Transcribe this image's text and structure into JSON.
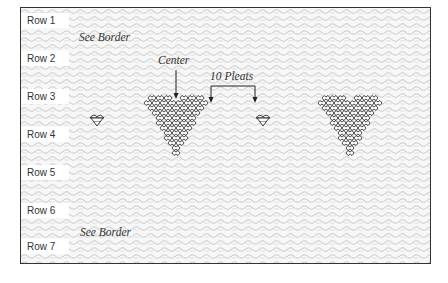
{
  "diagram": {
    "rows": [
      {
        "label": "Row 1",
        "top": 5
      },
      {
        "label": "Row 2",
        "top": 43
      },
      {
        "label": "Row 3",
        "top": 81
      },
      {
        "label": "Row 4",
        "top": 119
      },
      {
        "label": "Row 5",
        "top": 157
      },
      {
        "label": "Row 6",
        "top": 195
      },
      {
        "label": "Row 7",
        "top": 231
      }
    ],
    "annotations": {
      "see_border_top": "See Border",
      "center": "Center",
      "ten_pleats": "10 Pleats",
      "see_border_bottom": "See Border"
    },
    "motifs": [
      {
        "type": "small-motif",
        "x": 97,
        "y": 120
      },
      {
        "type": "heart-motif",
        "x": 178,
        "y": 95
      },
      {
        "type": "small-motif",
        "x": 263,
        "y": 120
      },
      {
        "type": "heart-motif",
        "x": 350,
        "y": 95
      }
    ],
    "colors": {
      "frame": "#333333",
      "pattern": "#bdbdbd",
      "motif": "#222222",
      "label_bg": "#ffffff"
    }
  }
}
